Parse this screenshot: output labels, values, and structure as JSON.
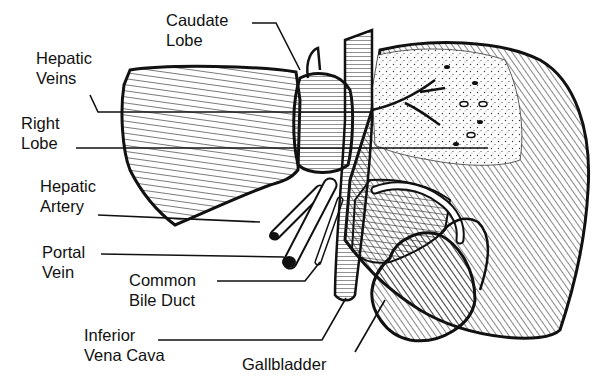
{
  "diagram": {
    "labels": [
      {
        "id": "caudate-lobe",
        "lines": [
          "Caudate",
          "Lobe"
        ],
        "x": 166,
        "y": 10
      },
      {
        "id": "hepatic-veins",
        "lines": [
          "Hepatic",
          "Veins"
        ],
        "x": 36,
        "y": 48
      },
      {
        "id": "right-lobe",
        "lines": [
          "Right",
          "Lobe"
        ],
        "x": 21,
        "y": 113
      },
      {
        "id": "hepatic-artery",
        "lines": [
          "Hepatic",
          "Artery"
        ],
        "x": 40,
        "y": 176
      },
      {
        "id": "portal-vein",
        "lines": [
          "Portal",
          "Vein"
        ],
        "x": 42,
        "y": 242
      },
      {
        "id": "common-bile-duct",
        "lines": [
          "Common",
          "Bile Duct"
        ],
        "x": 129,
        "y": 270
      },
      {
        "id": "inferior-vena-cava",
        "lines": [
          "Inferior",
          "Vena Cava"
        ],
        "x": 84,
        "y": 325
      },
      {
        "id": "gallbladder",
        "lines": [
          "Gallbladder"
        ],
        "x": 242,
        "y": 354
      }
    ]
  }
}
